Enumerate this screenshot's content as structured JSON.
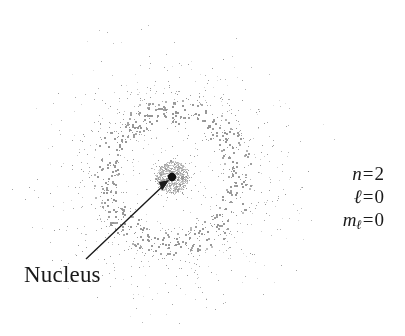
{
  "figure": {
    "background_color": "#ffffff",
    "width": 405,
    "height": 336
  },
  "nucleus": {
    "label": "Nucleus",
    "center_x": 172,
    "center_y": 177,
    "dot_radius": 4,
    "dot_color": "#111111",
    "pointer": {
      "from_x": 86,
      "from_y": 259,
      "to_x": 169,
      "to_y": 180,
      "color": "#1a1a1a",
      "width": 1.4,
      "arrow_head": "at-nucleus"
    }
  },
  "quantum_numbers": [
    {
      "symbol": "n",
      "subscript": "",
      "equals": "=",
      "value": "2"
    },
    {
      "symbol": "ℓ",
      "subscript": "",
      "equals": "=",
      "value": "0"
    },
    {
      "symbol": "m",
      "subscript": "ℓ",
      "equals": "=",
      "value": "0"
    }
  ],
  "chart_data": {
    "type": "scatter",
    "xlabel": "",
    "ylabel": "",
    "center": [
      172,
      177
    ],
    "dot_color": "#8c8c8c",
    "dot_count": 9000,
    "point_size_px": [
      1,
      2
    ],
    "radial_profile": {
      "radius_bins": [
        0,
        6,
        12,
        18,
        24,
        30,
        36,
        42,
        48,
        54,
        60,
        66,
        72,
        80,
        90,
        100,
        110,
        125,
        140,
        155,
        170
      ],
      "density": [
        0.98,
        0.92,
        0.74,
        0.5,
        0.3,
        0.18,
        0.13,
        0.16,
        0.3,
        0.62,
        0.95,
        1.0,
        0.86,
        0.55,
        0.34,
        0.21,
        0.13,
        0.07,
        0.035,
        0.015,
        0.0
      ],
      "node_radius": 36,
      "shell_peak_radius": 64,
      "outer_cutoff_radius": 170
    },
    "grid": false,
    "legend": "none"
  }
}
